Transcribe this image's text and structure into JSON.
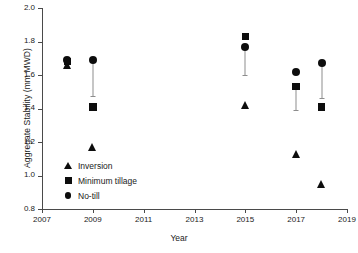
{
  "chart_data": {
    "type": "scatter",
    "title": "",
    "xlabel": "Year",
    "ylabel": "Aggregate Stability (mm MWD)",
    "xlim": [
      2007,
      2019
    ],
    "ylim": [
      0.8,
      2.0
    ],
    "xticks": [
      2007,
      2009,
      2011,
      2013,
      2015,
      2017,
      2019
    ],
    "xtick_labels": [
      "2007",
      "2009",
      "2011",
      "2013",
      "2015",
      "2017",
      "2019"
    ],
    "yticks": [
      0.8,
      1.0,
      1.2,
      1.4,
      1.6,
      1.8,
      2.0
    ],
    "ytick_labels": [
      "0.8",
      "1.0",
      "1.2",
      "1.4",
      "1.6",
      "1.8",
      "2.0"
    ],
    "grid": false,
    "legend_position": "lower-left",
    "marker_color": "#0d0d0d",
    "errorbar_color": "#8d8d8d",
    "axis_color": "#4a4a4a",
    "series": [
      {
        "name": "Inversion",
        "marker": "triangle",
        "x": [
          2008,
          2009,
          2015,
          2017,
          2018
        ],
        "values": [
          1.66,
          1.17,
          1.42,
          1.13,
          0.95
        ],
        "errors": [
          null,
          null,
          null,
          null,
          null
        ]
      },
      {
        "name": "Minimum tillage",
        "marker": "square",
        "x": [
          2008,
          2009,
          2015,
          2017,
          2018
        ],
        "values": [
          1.68,
          1.41,
          1.83,
          1.53,
          1.41
        ],
        "errors": [
          null,
          null,
          null,
          0.14,
          null
        ]
      },
      {
        "name": "No-till",
        "marker": "circle",
        "x": [
          2008,
          2009,
          2015,
          2017,
          2018
        ],
        "values": [
          1.69,
          1.69,
          1.77,
          1.62,
          1.67
        ],
        "errors": [
          null,
          0.215,
          0.17,
          null,
          0.205
        ]
      }
    ],
    "errorbars": [
      {
        "x": 2009,
        "top": 1.69,
        "bottom": 1.475
      },
      {
        "x": 2015,
        "top": 1.77,
        "bottom": 1.6
      },
      {
        "x": 2017,
        "top": 1.53,
        "bottom": 1.39
      },
      {
        "x": 2018,
        "top": 1.67,
        "bottom": 1.465
      }
    ]
  },
  "legend": {
    "items": [
      {
        "label": "Inversion",
        "marker": "triangle"
      },
      {
        "label": "Minimum tillage",
        "marker": "square"
      },
      {
        "label": "No-till",
        "marker": "circle"
      }
    ]
  }
}
